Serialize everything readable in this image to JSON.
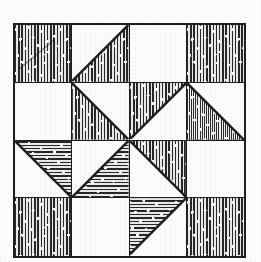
{
  "figure": {
    "grid_rows": 4,
    "grid_columns": 4,
    "background_color": "#fdfdfb",
    "ink_color": "#1c1c1c",
    "fabric_fill_color": "#6f6f6f"
  },
  "legend": {
    "textures": [
      {
        "id": "vertical",
        "name": "vertical-stripe-with-dots"
      },
      {
        "id": "horizontal",
        "name": "horizontal-stripe-with-dots"
      },
      {
        "id": "crosshatch",
        "name": "crosshatch-with-dots"
      },
      {
        "id": "none",
        "name": "plain-white"
      }
    ],
    "shapes": [
      {
        "id": "full",
        "name": "full-square"
      },
      {
        "id": "tri-ul",
        "name": "triangle-upper-left"
      },
      {
        "id": "tri-ur",
        "name": "triangle-upper-right"
      },
      {
        "id": "tri-ll",
        "name": "triangle-lower-left"
      },
      {
        "id": "tri-lr",
        "name": "triangle-lower-right"
      },
      {
        "id": "empty",
        "name": "empty-square"
      }
    ]
  },
  "cells": [
    {
      "row": 1,
      "col": 1,
      "shape": "full",
      "texture": "vertical",
      "name": "cell-r1c1"
    },
    {
      "row": 1,
      "col": 2,
      "shape": "tri-lr",
      "texture": "vertical",
      "name": "cell-r1c2"
    },
    {
      "row": 1,
      "col": 3,
      "shape": "empty",
      "texture": "none",
      "name": "cell-r1c3"
    },
    {
      "row": 1,
      "col": 4,
      "shape": "full",
      "texture": "vertical",
      "name": "cell-r1c4"
    },
    {
      "row": 2,
      "col": 1,
      "shape": "empty",
      "texture": "none",
      "name": "cell-r2c1"
    },
    {
      "row": 2,
      "col": 2,
      "shape": "tri-ll",
      "texture": "vertical",
      "name": "cell-r2c2"
    },
    {
      "row": 2,
      "col": 3,
      "shape": "tri-ul",
      "texture": "vertical",
      "name": "cell-r2c3"
    },
    {
      "row": 2,
      "col": 4,
      "shape": "tri-ll",
      "texture": "crosshatch",
      "name": "cell-r2c4"
    },
    {
      "row": 3,
      "col": 1,
      "shape": "tri-ur",
      "texture": "horizontal",
      "name": "cell-r3c1"
    },
    {
      "row": 3,
      "col": 2,
      "shape": "tri-lr",
      "texture": "horizontal",
      "name": "cell-r3c2"
    },
    {
      "row": 3,
      "col": 3,
      "shape": "tri-ur",
      "texture": "vertical",
      "name": "cell-r3c3"
    },
    {
      "row": 3,
      "col": 4,
      "shape": "empty",
      "texture": "none",
      "name": "cell-r3c4"
    },
    {
      "row": 4,
      "col": 1,
      "shape": "full",
      "texture": "vertical",
      "name": "cell-r4c1"
    },
    {
      "row": 4,
      "col": 2,
      "shape": "empty",
      "texture": "none",
      "name": "cell-r4c2"
    },
    {
      "row": 4,
      "col": 3,
      "shape": "tri-ul",
      "texture": "horizontal",
      "name": "cell-r4c3"
    },
    {
      "row": 4,
      "col": 4,
      "shape": "full",
      "texture": "vertical",
      "name": "cell-r4c4"
    }
  ]
}
